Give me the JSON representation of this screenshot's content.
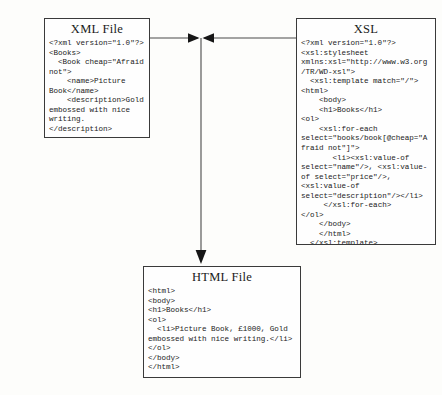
{
  "diagram": {
    "line_color": "#4a4a4a",
    "box_border_color": "#3a3a3a",
    "background_color": "#fdfdfb"
  },
  "xml_box": {
    "title": "XML File",
    "code": "<?xml version=\"1.0\"?>\n<Books>\n  <Book cheap=\"Afraid not\">\n    <name>Picture Book</name>\n    <description>Gold embossed with nice writing.</description>\n    <price>1000</price>\n  </Book>\n</Books>"
  },
  "xsl_box": {
    "title": "XSL",
    "code": "<?xml version=\"1.0\"?>\n<xsl:stylesheet xmlns:xsl=\"http://www.w3.org/TR/WD-xsl\">\n  <xsl:template match=\"/\">\n<html>\n    <body>\n    <h1>Books</h1>\n<ol>\n    <xsl:for-each select=\"books/book[@cheap=\"Afraid not\"]\">\n       <li><xsl:value-of select=\"name\"/>, <xsl:value-of select=\"price\"/>, <xsl:value-of select=\"description\"/></li>\n     </xsl:for-each>\n</ol>\n    </body>\n    </html>\n  </xsl:template>\n</xsl:stylesheet>"
  },
  "html_box": {
    "title": "HTML File",
    "code": "<html>\n<body>\n<h1>Books</h1>\n<ol>\n  <li>Picture Book, £1000, Gold embossed with nice writing.</li>\n</ol>\n</body>\n</html>"
  },
  "connectors": {
    "xml_to_junction": "horizontal line from XML File right edge to center junction",
    "xsl_to_junction": "horizontal line from XSL left edge to center junction",
    "junction_to_html": "vertical arrow down into HTML File"
  }
}
